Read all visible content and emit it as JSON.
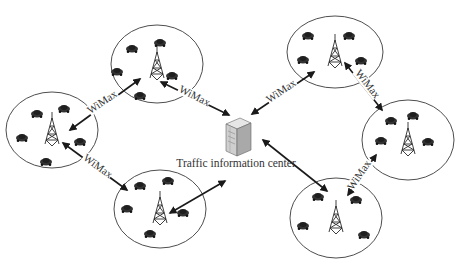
{
  "diagram": {
    "type": "network",
    "center": {
      "label": "Traffic information center",
      "icon": "server-icon",
      "x": 236,
      "y": 142
    },
    "link_label": "WiMax",
    "cells": [
      {
        "id": "cell-top-left",
        "cx": 157,
        "cy": 64,
        "rx": 46,
        "ry": 39,
        "cars": [
          [
            132,
            49
          ],
          [
            160,
            43
          ],
          [
            117,
            72
          ],
          [
            172,
            76
          ],
          [
            140,
            96
          ]
        ]
      },
      {
        "id": "cell-left",
        "cx": 52,
        "cy": 130,
        "rx": 46,
        "ry": 38,
        "cars": [
          [
            37,
            114
          ],
          [
            64,
            109
          ],
          [
            22,
            138
          ],
          [
            80,
            142
          ],
          [
            46,
            162
          ]
        ]
      },
      {
        "id": "cell-bottom-left",
        "cx": 160,
        "cy": 209,
        "rx": 46,
        "ry": 39,
        "cars": [
          [
            140,
            186
          ],
          [
            168,
            181
          ],
          [
            127,
            209
          ],
          [
            183,
            213
          ],
          [
            150,
            234
          ]
        ]
      },
      {
        "id": "cell-top-right",
        "cx": 335,
        "cy": 52,
        "rx": 48,
        "ry": 36,
        "cars": [
          [
            308,
            36
          ],
          [
            349,
            36
          ],
          [
            303,
            60
          ],
          [
            361,
            61
          ]
        ]
      },
      {
        "id": "cell-right",
        "cx": 408,
        "cy": 140,
        "rx": 46,
        "ry": 40,
        "cars": [
          [
            391,
            121
          ],
          [
            413,
            116
          ],
          [
            381,
            141
          ],
          [
            428,
            142
          ]
        ]
      },
      {
        "id": "cell-bottom-right",
        "cx": 336,
        "cy": 218,
        "rx": 46,
        "ry": 40,
        "cars": [
          [
            318,
            197
          ],
          [
            356,
            200
          ],
          [
            303,
            226
          ],
          [
            364,
            235
          ]
        ]
      }
    ],
    "links": [
      {
        "from": "cell-left",
        "to": "cell-top-left",
        "x1": 70,
        "y1": 130,
        "x2": 140,
        "y2": 79,
        "label": "WiMax",
        "lx": 104,
        "ly": 104,
        "angle": -34
      },
      {
        "from": "cell-top-left",
        "to": "center",
        "x1": 161,
        "y1": 82,
        "x2": 229,
        "y2": 115,
        "label": "WiMax",
        "lx": 193,
        "ly": 98,
        "angle": 27
      },
      {
        "from": "cell-left",
        "to": "cell-bottom-left",
        "x1": 63,
        "y1": 143,
        "x2": 127,
        "y2": 190,
        "label": "WiMax",
        "lx": 96,
        "ly": 168,
        "angle": 36
      },
      {
        "from": "center",
        "to": "cell-bottom-left",
        "x1": 225,
        "y1": 181,
        "x2": 170,
        "y2": 213,
        "label": "",
        "lx": 0,
        "ly": 0,
        "angle": 0
      },
      {
        "from": "center",
        "to": "cell-top-right",
        "x1": 252,
        "y1": 114,
        "x2": 314,
        "y2": 72,
        "label": "WiMax",
        "lx": 283,
        "ly": 93,
        "angle": -34
      },
      {
        "from": "cell-top-right",
        "to": "cell-right",
        "x1": 345,
        "y1": 63,
        "x2": 382,
        "y2": 110,
        "label": "WiMax",
        "lx": 365,
        "ly": 85,
        "angle": 52
      },
      {
        "from": "center",
        "to": "cell-bottom-right",
        "x1": 263,
        "y1": 140,
        "x2": 327,
        "y2": 191,
        "label": "",
        "lx": 0,
        "ly": 0,
        "angle": 0
      },
      {
        "from": "cell-bottom-right",
        "to": "cell-right",
        "x1": 348,
        "y1": 195,
        "x2": 376,
        "y2": 155,
        "label": "WiMax",
        "lx": 362,
        "ly": 176,
        "angle": -56
      }
    ]
  }
}
